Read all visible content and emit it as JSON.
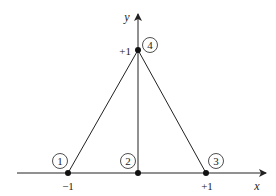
{
  "axes": {
    "x_label": "x",
    "y_label": "y"
  },
  "ticks": {
    "x_neg": "−1",
    "x_pos": "+1",
    "y_pos": "+1"
  },
  "nodes": [
    {
      "id": "1",
      "x": -1,
      "y": 0
    },
    {
      "id": "2",
      "x": 0,
      "y": 0
    },
    {
      "id": "3",
      "x": 1,
      "y": 0
    },
    {
      "id": "4",
      "x": 0,
      "y": 1
    }
  ],
  "edges": [
    [
      "1",
      "4"
    ],
    [
      "4",
      "3"
    ],
    [
      "2",
      "4"
    ],
    [
      "1",
      "3"
    ]
  ]
}
